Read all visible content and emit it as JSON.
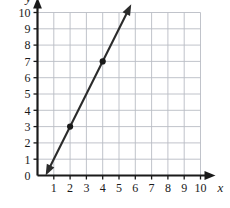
{
  "chart_data": {
    "type": "line",
    "title": "",
    "subtitle": "",
    "xlabel": "x",
    "ylabel": "y",
    "xlim": [
      0,
      10
    ],
    "ylim": [
      0,
      10
    ],
    "grid": true,
    "legend": null,
    "x_ticks": [
      1,
      2,
      3,
      4,
      5,
      6,
      7,
      8,
      9,
      10
    ],
    "x_tick_labels": [
      "1",
      "2",
      "3",
      "4",
      "5",
      "6",
      "7",
      "8",
      "9",
      "10"
    ],
    "y_ticks": [
      0,
      1,
      2,
      3,
      4,
      5,
      6,
      7,
      8,
      9,
      10
    ],
    "y_tick_labels": [
      "0",
      "1",
      "2",
      "3",
      "4",
      "5",
      "6",
      "7",
      "8",
      "9",
      "10"
    ],
    "origin_label": "0",
    "series": [
      {
        "name": "line",
        "kind": "line",
        "slope": 2,
        "intercept": -1,
        "equation": "y = 2x - 1",
        "color": "#2b2b2b",
        "arrow_start": true,
        "arrow_end": true,
        "x_start": 0.5,
        "y_start": 0,
        "x_end": 5.75,
        "y_end": 10.5,
        "marked_points": [
          {
            "x": 2,
            "y": 3,
            "label": "(2, 3)"
          },
          {
            "x": 4,
            "y": 7,
            "label": "(4, 7)"
          }
        ]
      }
    ],
    "colors": {
      "axis": "#1a1a1a",
      "grid": "#b9bcc4",
      "line": "#2b2b2b",
      "point": "#1a1a1a",
      "background": "#ffffff"
    }
  }
}
